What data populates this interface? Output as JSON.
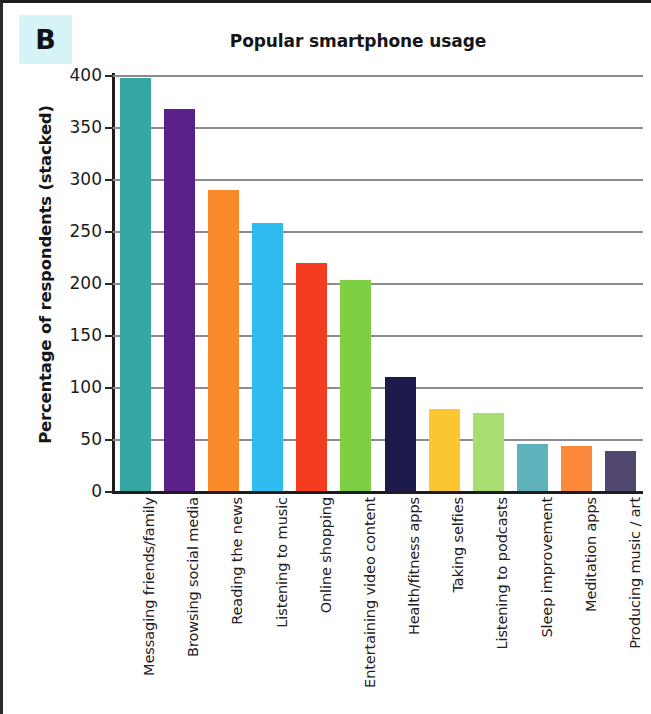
{
  "panel": {
    "letter": "B",
    "letter_bg": "#d6f4f7"
  },
  "chart_data": {
    "type": "bar",
    "title": "Popular smartphone usage",
    "xlabel": "",
    "ylabel": "Percentage of respondents (stacked)",
    "ylim": [
      0,
      400
    ],
    "ytick_step": 50,
    "ytick_labels": [
      "400",
      "350",
      "300",
      "250",
      "200",
      "150",
      "100",
      "50",
      "0"
    ],
    "yticks": [
      400,
      350,
      300,
      250,
      200,
      150,
      100,
      50,
      0
    ],
    "grid": true,
    "legend": "none",
    "categories": [
      "Messaging friends/family",
      "Browsing social media",
      "Reading the news",
      "Listening to music",
      "Online shopping",
      "Entertaining video content",
      "Health/fitness apps",
      "Taking selfies",
      "Listening to podcasts",
      "Sleep improvement",
      "Meditation apps",
      "Producing music / art"
    ],
    "values": [
      397,
      367,
      289,
      258,
      219,
      203,
      110,
      79,
      75,
      45,
      43,
      38
    ],
    "colors": [
      "#35a8a4",
      "#5b2189",
      "#fa8a28",
      "#2fbcf0",
      "#f53b20",
      "#7fcf43",
      "#1c1b4b",
      "#fbc62f",
      "#a8dd72",
      "#5fb2bb",
      "#fa8a3a",
      "#52486e"
    ]
  }
}
